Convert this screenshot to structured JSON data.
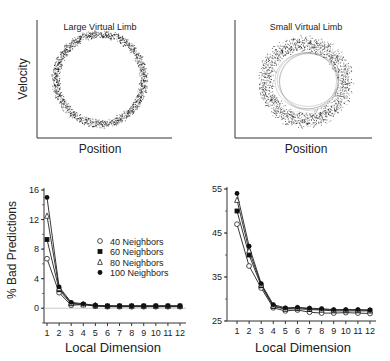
{
  "chart_data": [
    {
      "type": "scatter",
      "title": "Large Virtual Limb",
      "xlabel": "Position",
      "ylabel": "Velocity",
      "description": "Phase-plane trajectory forming a tight circular ring",
      "grid": false
    },
    {
      "type": "scatter",
      "title": "Small Virtual Limb",
      "xlabel": "Position",
      "ylabel": "",
      "description": "Phase-plane trajectory forming a broader, noisier ring",
      "grid": false
    },
    {
      "type": "line",
      "title": "",
      "xlabel": "Local Dimension",
      "ylabel": "% Bad Predictions",
      "x": [
        1,
        2,
        3,
        4,
        5,
        6,
        7,
        8,
        9,
        10,
        11,
        12
      ],
      "ylim": [
        -2,
        16
      ],
      "yticks": [
        0,
        4,
        8,
        12,
        16
      ],
      "legend_position": "center-right",
      "series": [
        {
          "name": "40 Neighbors",
          "marker": "open-circle",
          "values": [
            6.7,
            2.1,
            0.4,
            0.5,
            0.3,
            0.2,
            0.2,
            0.2,
            0.2,
            0.2,
            0.2,
            0.2
          ]
        },
        {
          "name": "60 Neighbors",
          "marker": "filled-square",
          "values": [
            9.3,
            2.5,
            0.6,
            0.5,
            0.3,
            0.3,
            0.3,
            0.3,
            0.3,
            0.3,
            0.3,
            0.3
          ]
        },
        {
          "name": "80 Neighbors",
          "marker": "open-triangle",
          "values": [
            12.5,
            2.7,
            0.7,
            0.5,
            0.4,
            0.3,
            0.3,
            0.3,
            0.3,
            0.3,
            0.3,
            0.3
          ]
        },
        {
          "name": "100 Neighbors",
          "marker": "filled-circle",
          "values": [
            15.0,
            2.9,
            0.8,
            0.6,
            0.4,
            0.3,
            0.3,
            0.3,
            0.3,
            0.3,
            0.3,
            0.3
          ]
        }
      ]
    },
    {
      "type": "line",
      "title": "",
      "xlabel": "Local Dimension",
      "ylabel": "",
      "x": [
        1,
        2,
        3,
        4,
        5,
        6,
        7,
        8,
        9,
        10,
        11,
        12
      ],
      "ylim": [
        25,
        55
      ],
      "yticks": [
        25,
        35,
        45,
        55
      ],
      "series": [
        {
          "name": "40 Neighbors",
          "marker": "open-circle",
          "values": [
            47.0,
            37.5,
            32.5,
            28.0,
            27.3,
            27.5,
            27.0,
            26.8,
            26.8,
            26.9,
            26.8,
            26.7
          ]
        },
        {
          "name": "60 Neighbors",
          "marker": "filled-square",
          "values": [
            50.0,
            40.0,
            33.0,
            28.3,
            27.7,
            27.8,
            27.6,
            27.5,
            27.3,
            27.3,
            27.3,
            27.3
          ]
        },
        {
          "name": "80 Neighbors",
          "marker": "open-triangle",
          "values": [
            52.5,
            41.0,
            33.3,
            28.5,
            27.8,
            28.0,
            27.8,
            27.6,
            27.5,
            27.5,
            27.5,
            27.4
          ]
        },
        {
          "name": "100 Neighbors",
          "marker": "filled-circle",
          "values": [
            54.0,
            42.0,
            33.5,
            28.7,
            28.0,
            28.1,
            27.9,
            27.8,
            27.6,
            27.6,
            27.6,
            27.5
          ]
        }
      ]
    }
  ],
  "labels": {
    "tl_title": "Large Virtual Limb",
    "tr_title": "Small Virtual Limb",
    "tl_xlabel": "Position",
    "tr_xlabel": "Position",
    "tl_ylabel": "Velocity",
    "bl_ylabel": "% Bad Predictions",
    "bl_xlabel": "Local Dimension",
    "br_xlabel": "Local Dimension"
  }
}
